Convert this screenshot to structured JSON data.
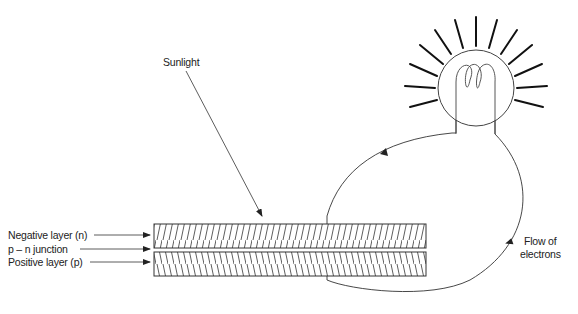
{
  "diagram": {
    "type": "solar-cell-circuit",
    "labels": {
      "sunlight": "Sunlight",
      "negative_layer": "Negative layer (n)",
      "junction": "p – n junction",
      "positive_layer": "Positive layer (p)",
      "flow_line1": "Flow of",
      "flow_line2": "electrons"
    },
    "components": [
      {
        "id": "negative-layer",
        "hatch": "forward-slash"
      },
      {
        "id": "pn-junction",
        "hatch": "none"
      },
      {
        "id": "positive-layer",
        "hatch": "back-slash"
      },
      {
        "id": "light-bulb",
        "state": "lit"
      },
      {
        "id": "wire-loop",
        "direction": "from negative layer up to bulb, back down to positive layer"
      }
    ],
    "colors": {
      "stroke": "#333333",
      "background": "#ffffff",
      "text": "#222222"
    }
  }
}
